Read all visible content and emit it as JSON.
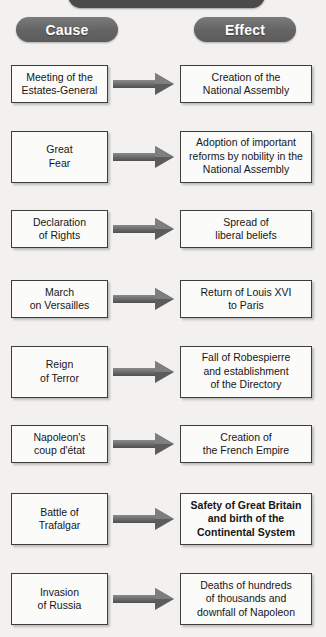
{
  "title": "The French Revolution",
  "columns": {
    "cause_label": "Cause",
    "effect_label": "Effect"
  },
  "colors": {
    "background": "#f2f1ef",
    "title_pill": "#4a4a4a",
    "header_pill": "#6d6d6d",
    "box_fill": "#fbfbfa",
    "box_border": "#3d3d3d",
    "arrow": "#5c5c5c",
    "pill_text": "#ffffff",
    "box_text": "#161616"
  },
  "icons": {
    "arrow": "right-arrow-icon"
  },
  "rows": [
    {
      "cause": "Meeting of the\nEstates-General",
      "effect": "Creation of the\nNational Assembly",
      "effect_bold": false
    },
    {
      "cause": "Great\nFear",
      "effect": "Adoption of important\nreforms by nobility in the\nNational Assembly",
      "effect_bold": false
    },
    {
      "cause": "Declaration\nof Rights",
      "effect": "Spread of\nliberal beliefs",
      "effect_bold": false
    },
    {
      "cause": "March\non Versailles",
      "effect": "Return of Louis XVI\nto Paris",
      "effect_bold": false
    },
    {
      "cause": "Reign\nof Terror",
      "effect": "Fall of Robespierre\nand establishment\nof the Directory",
      "effect_bold": false
    },
    {
      "cause": "Napoleon's\ncoup d'état",
      "effect": "Creation of\nthe French Empire",
      "effect_bold": false
    },
    {
      "cause": "Battle of\nTrafalgar",
      "effect": "Safety of Great Britain\nand birth of the\nContinental System",
      "effect_bold": true
    },
    {
      "cause": "Invasion\nof Russia",
      "effect": "Deaths of hundreds\nof thousands and\ndownfall of Napoleon",
      "effect_bold": false
    }
  ]
}
